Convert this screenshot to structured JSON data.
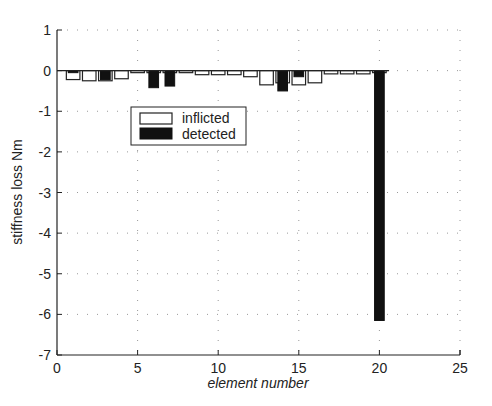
{
  "chart_data": {
    "type": "bar",
    "title": "",
    "xlabel": "element number",
    "ylabel": "stiffness loss Nm",
    "xlim": [
      0,
      25
    ],
    "ylim": [
      -7,
      1
    ],
    "xticks": [
      0,
      5,
      10,
      15,
      20,
      25
    ],
    "yticks": [
      1,
      0,
      -1,
      -2,
      -3,
      -4,
      -5,
      -6,
      -7
    ],
    "grid": "dotted",
    "legend_position": "upper-left-inside",
    "categories": [
      1,
      2,
      3,
      4,
      5,
      6,
      7,
      8,
      9,
      10,
      11,
      12,
      13,
      14,
      15,
      16,
      17,
      18,
      19,
      20
    ],
    "series": [
      {
        "name": "inflicted",
        "fill": "#ffffff",
        "values": [
          -0.22,
          -0.25,
          -0.25,
          -0.2,
          -0.05,
          -0.05,
          -0.05,
          -0.05,
          -0.1,
          -0.1,
          -0.1,
          -0.15,
          -0.35,
          -0.3,
          -0.35,
          -0.3,
          -0.08,
          -0.08,
          -0.08,
          -0.05
        ]
      },
      {
        "name": "detected",
        "fill": "#111111",
        "values": [
          -0.05,
          0,
          -0.22,
          0,
          0,
          -0.42,
          -0.38,
          0,
          0,
          0,
          0,
          0,
          0,
          -0.5,
          -0.15,
          0,
          0,
          0,
          0,
          -6.15
        ]
      }
    ]
  },
  "labels": {
    "xlabel": "element number",
    "ylabel": "stiffness loss Nm",
    "legend_inflicted": "inflicted",
    "legend_detected": "detected"
  }
}
